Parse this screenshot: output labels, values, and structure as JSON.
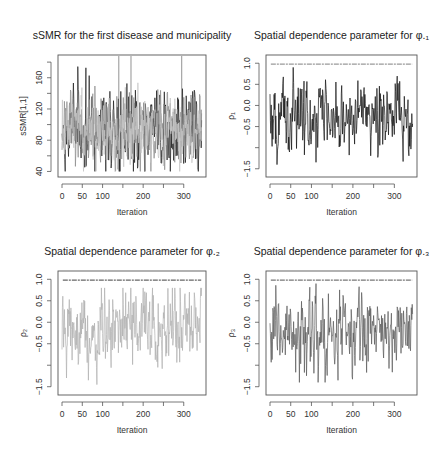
{
  "chart_data": [
    {
      "type": "line",
      "panel": "top-left",
      "title": "sSMR for the first disease and municipality",
      "xlabel": "Iteration",
      "ylabel": "sSMR[1,1]",
      "xlim": [
        0,
        345
      ],
      "ylim": [
        38,
        184
      ],
      "x_ticks": [
        0,
        50,
        100,
        150,
        200,
        250,
        300
      ],
      "x_tick_labels": [
        "0",
        "50",
        "100",
        "",
        "200",
        "",
        "300"
      ],
      "y_ticks": [
        40,
        60,
        80,
        100,
        120,
        140,
        160,
        180
      ],
      "y_tick_labels": [
        "40",
        "",
        "80",
        "",
        "120",
        "",
        "160",
        ""
      ],
      "grid": false,
      "series": [
        {
          "name": "chain-1",
          "color": "#1a1a1a",
          "mean": 95,
          "sd": 24,
          "min": 40,
          "max": 180,
          "n": 345,
          "seed": 11
        },
        {
          "name": "chain-2",
          "color": "#8a8a8a",
          "mean": 92,
          "sd": 22,
          "min": 40,
          "max": 170,
          "n": 345,
          "seed": 23
        },
        {
          "name": "chain-3",
          "color": "#c4c4c4",
          "mean": 90,
          "sd": 20,
          "min": 40,
          "max": 160,
          "n": 345,
          "seed": 37
        }
      ],
      "annotations": [
        "vertical spikes near iterations 140, 170, 295 reaching top of axis"
      ]
    },
    {
      "type": "line",
      "panel": "top-right",
      "title": "Spatial dependence parameter for φ.₁",
      "xlabel": "Iteration",
      "ylabel": "ρ₁",
      "xlim": [
        0,
        345
      ],
      "ylim": [
        -1.6,
        1.1
      ],
      "x_ticks": [
        0,
        50,
        100,
        150,
        200,
        250,
        300
      ],
      "x_tick_labels": [
        "0",
        "50",
        "100",
        "",
        "200",
        "",
        "300"
      ],
      "y_ticks": [
        -1.5,
        -1.0,
        -0.5,
        0.0,
        0.5,
        1.0
      ],
      "y_tick_labels": [
        "-1.5",
        "",
        "-0.5",
        "0.0",
        "0.5",
        "1.0"
      ],
      "grid": false,
      "series": [
        {
          "name": "chain-1",
          "color": "#111111",
          "mean": -0.25,
          "sd": 0.38,
          "min": -1.4,
          "max": 0.9,
          "n": 345,
          "seed": 51
        },
        {
          "name": "constant",
          "color": "#999999",
          "value": 0.98
        }
      ]
    },
    {
      "type": "line",
      "panel": "bottom-left",
      "title": "Spatial dependence parameter for φ.₂",
      "xlabel": "Iteration",
      "ylabel": "ρ₂",
      "xlim": [
        0,
        345
      ],
      "ylim": [
        -1.6,
        1.1
      ],
      "x_ticks": [
        0,
        50,
        100,
        150,
        200,
        250,
        300
      ],
      "x_tick_labels": [
        "0",
        "50",
        "100",
        "",
        "200",
        "",
        "300"
      ],
      "y_ticks": [
        -1.5,
        -1.0,
        -0.5,
        0.0,
        0.5,
        1.0
      ],
      "y_tick_labels": [
        "-1.5",
        "",
        "-0.5",
        "0.0",
        "0.5",
        "1.0"
      ],
      "grid": false,
      "series": [
        {
          "name": "chain-1",
          "color": "#b0b0b0",
          "mean": -0.25,
          "sd": 0.38,
          "min": -1.45,
          "max": 0.8,
          "n": 345,
          "seed": 67
        },
        {
          "name": "constant",
          "color": "#666666",
          "value": 0.98
        }
      ]
    },
    {
      "type": "line",
      "panel": "bottom-right",
      "title": "Spatial dependence parameter for φ.₃",
      "xlabel": "Iteration",
      "ylabel": "ρ₃",
      "xlim": [
        0,
        345
      ],
      "ylim": [
        -1.6,
        1.1
      ],
      "x_ticks": [
        0,
        50,
        100,
        150,
        200,
        250,
        300
      ],
      "x_tick_labels": [
        "0",
        "50",
        "100",
        "",
        "200",
        "",
        "300"
      ],
      "y_ticks": [
        -1.5,
        -1.0,
        -0.5,
        0.0,
        0.5,
        1.0
      ],
      "y_tick_labels": [
        "-1.5",
        "",
        "-0.5",
        "0.0",
        "0.5",
        "1.0"
      ],
      "grid": false,
      "series": [
        {
          "name": "chain-1",
          "color": "#5a5a5a",
          "mean": -0.25,
          "sd": 0.4,
          "min": -1.4,
          "max": 0.9,
          "n": 345,
          "seed": 83
        },
        {
          "name": "constant",
          "color": "#777777",
          "value": 0.98
        }
      ]
    }
  ],
  "layout": {
    "panels": [
      {
        "box": [
          58,
          55,
          206,
          177
        ]
      },
      {
        "box": [
          266,
          55,
          417,
          177
        ]
      },
      {
        "box": [
          58,
          271,
          206,
          395
        ]
      },
      {
        "box": [
          266,
          271,
          417,
          395
        ]
      }
    ]
  }
}
